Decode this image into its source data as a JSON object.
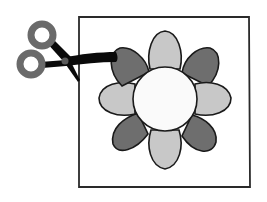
{
  "illustration": {
    "subject": "scissors cutting a framed flower",
    "colors": {
      "background": "#ffffff",
      "frame_stroke": "#2a2a2a",
      "petal_dark": "#6e6e6e",
      "petal_light": "#c8c8c8",
      "center_fill": "#fafafa",
      "outline": "#1a1a1a",
      "scissor_blade": "#0a0a0a",
      "scissor_handle": "#6a6a6a",
      "scissor_pivot": "#5a5a5a"
    },
    "flower": {
      "center_x": 165,
      "center_y": 99,
      "center_radius": 32,
      "petal_count": 8,
      "petal_pattern": [
        "light",
        "dark",
        "light",
        "dark",
        "light",
        "dark",
        "light",
        "dark"
      ]
    },
    "frame": {
      "x": 79,
      "y": 17,
      "width": 170,
      "height": 170
    }
  }
}
